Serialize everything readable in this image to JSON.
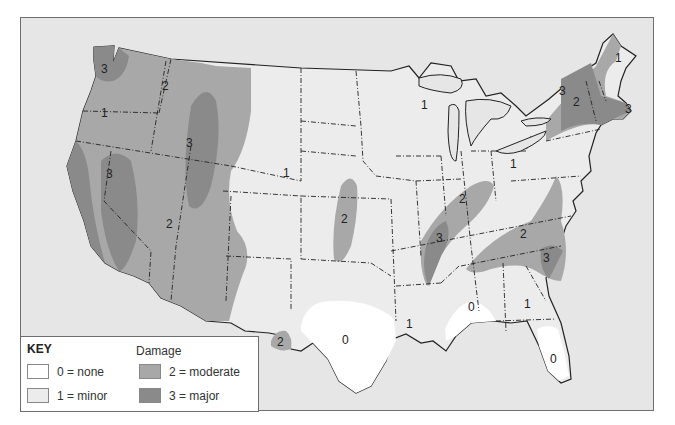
{
  "map": {
    "title": "Damage",
    "colors": {
      "ocean": "#e6e6e6",
      "level_0": "#ffffff",
      "level_1": "#ececec",
      "level_2": "#a8a8a8",
      "level_3": "#8a8a8a",
      "border": "#222222"
    },
    "region_labels": [
      {
        "id": "wa",
        "text": "3",
        "x": 103,
        "y": 68
      },
      {
        "id": "or",
        "text": "1",
        "x": 103,
        "y": 112
      },
      {
        "id": "id",
        "text": "2",
        "x": 164,
        "y": 85
      },
      {
        "id": "mt-wy",
        "text": "3",
        "x": 188,
        "y": 142
      },
      {
        "id": "nv",
        "text": "3",
        "x": 108,
        "y": 173
      },
      {
        "id": "az",
        "text": "2",
        "x": 168,
        "y": 223
      },
      {
        "id": "co-ne",
        "text": "1",
        "x": 285,
        "y": 172
      },
      {
        "id": "ks",
        "text": "2",
        "x": 343,
        "y": 218
      },
      {
        "id": "wi",
        "text": "1",
        "x": 423,
        "y": 104
      },
      {
        "id": "in",
        "text": "2",
        "x": 461,
        "y": 198
      },
      {
        "id": "oh",
        "text": "1",
        "x": 512,
        "y": 163
      },
      {
        "id": "tn",
        "text": "3",
        "x": 438,
        "y": 237
      },
      {
        "id": "va",
        "text": "2",
        "x": 522,
        "y": 233
      },
      {
        "id": "sc",
        "text": "3",
        "x": 545,
        "y": 257
      },
      {
        "id": "ny-w",
        "text": "3",
        "x": 561,
        "y": 90
      },
      {
        "id": "ny",
        "text": "2",
        "x": 575,
        "y": 101
      },
      {
        "id": "me",
        "text": "1",
        "x": 617,
        "y": 57
      },
      {
        "id": "ma",
        "text": "3",
        "x": 627,
        "y": 108
      },
      {
        "id": "tx-w",
        "text": "2",
        "x": 279,
        "y": 341
      },
      {
        "id": "tx",
        "text": "0",
        "x": 344,
        "y": 339
      },
      {
        "id": "la",
        "text": "1",
        "x": 408,
        "y": 323
      },
      {
        "id": "ms-al",
        "text": "0",
        "x": 470,
        "y": 306
      },
      {
        "id": "ga",
        "text": "1",
        "x": 526,
        "y": 303
      },
      {
        "id": "fl",
        "text": "0",
        "x": 552,
        "y": 358
      }
    ]
  },
  "legend": {
    "key_label": "KEY",
    "heading": "Damage",
    "items": [
      {
        "level": 0,
        "label": "0 = none",
        "color": "#ffffff"
      },
      {
        "level": 1,
        "label": "1 = minor",
        "color": "#ececec"
      },
      {
        "level": 2,
        "label": "2 = moderate",
        "color": "#a8a8a8"
      },
      {
        "level": 3,
        "label": "3 = major",
        "color": "#8a8a8a"
      }
    ]
  }
}
